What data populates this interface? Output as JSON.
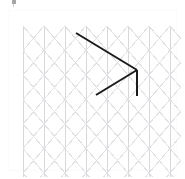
{
  "app": {
    "title": "Isometric Grid Drawing Canvas",
    "background_color": "#ffffff"
  },
  "top_artifact": {
    "name": "cropped-cursor-artifact",
    "color": "#8a8a8a",
    "x": 12,
    "y": 0,
    "width": 4,
    "height": 4
  },
  "canvas_panel": {
    "label": "Drawing panel",
    "x": 9,
    "y": 11,
    "width": 167,
    "height": 159,
    "background_color": "#ffffff",
    "border_color": "#fbfbfb"
  },
  "grid": {
    "label": "Isometric triangular grid",
    "type": "triangular-isometric",
    "x": 14,
    "y": 15,
    "width": 158,
    "height": 151,
    "line_color": "#e2e2e4",
    "line_color_strong": "#d8d8dc",
    "line_width": 1,
    "column_spacing": 21,
    "row_spacing": 24.5,
    "columns": 8,
    "rows": 7,
    "vertical_lines": true,
    "diagonal_lines": true
  },
  "drawing": {
    "label": "Drawn polyline",
    "stroke_color": "#1a1a1a",
    "stroke_width": 2,
    "line_cap": "butt",
    "segments": [
      {
        "name": "upper-diagonal",
        "description": "Long diagonal descending from upper-left to apex",
        "x1": 76,
        "y1": 33,
        "x2": 137,
        "y2": 70
      },
      {
        "name": "lower-diagonal",
        "description": "Diagonal ascending from lower-left to apex",
        "x1": 96,
        "y1": 95,
        "x2": 137,
        "y2": 70
      },
      {
        "name": "vertical-segment",
        "description": "Vertical segment dropping from apex",
        "x1": 137,
        "y1": 70,
        "x2": 137,
        "y2": 96
      }
    ],
    "vertices": [
      {
        "name": "upper-left-endpoint",
        "x": 76,
        "y": 33
      },
      {
        "name": "apex",
        "x": 137,
        "y": 70
      },
      {
        "name": "lower-left-endpoint",
        "x": 96,
        "y": 95
      },
      {
        "name": "vertical-bottom-endpoint",
        "x": 137,
        "y": 96
      }
    ]
  }
}
